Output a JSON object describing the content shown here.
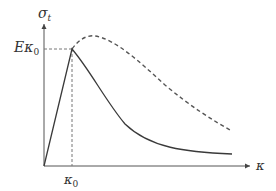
{
  "diagram": {
    "y_axis": {
      "symbol": "σ",
      "subscript": "t"
    },
    "x_axis": {
      "symbol": "κ"
    },
    "x_tick": {
      "symbol": "κ",
      "subscript": "0"
    },
    "y_tick": {
      "prefix": "E",
      "symbol": "κ",
      "subscript": "0"
    },
    "curves": [
      {
        "name": "softening-solid",
        "style": "solid",
        "description": "Linear rise to peak at (κ0, Eκ0) then exponential decay"
      },
      {
        "name": "dashed-curve",
        "style": "dashed",
        "description": "Continues rising past κ0 to a broader peak then declines"
      }
    ],
    "colors": {
      "line": "#3a3a3a",
      "dashed": "#555555",
      "guide": "#777777"
    }
  }
}
